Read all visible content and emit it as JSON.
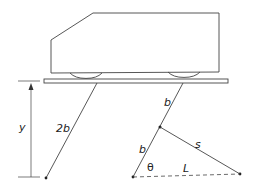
{
  "diagram": {
    "labels": {
      "height": "y",
      "left_link": "2b",
      "right_link_upper": "b",
      "right_link_lower": "b",
      "actuator": "s",
      "angle": "θ",
      "base_distance": "L"
    },
    "colors": {
      "stroke": "#333333",
      "background": "#ffffff"
    }
  }
}
